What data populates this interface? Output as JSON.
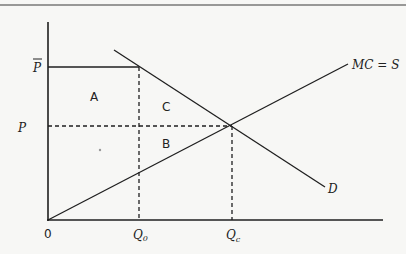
{
  "diagram": {
    "type": "supply-demand welfare diagram",
    "axes": {
      "origin_label": "0",
      "x_ticks": [
        {
          "label": "Q",
          "subscript": "0",
          "x": 139
        },
        {
          "label": "Q",
          "subscript": "c",
          "x": 232
        }
      ],
      "y_ticks": [
        {
          "label": "P",
          "overline": true,
          "name": "P-bar",
          "y": 67
        },
        {
          "label": "P",
          "overline": false,
          "name": "P",
          "y": 126
        }
      ]
    },
    "curves": {
      "demand": {
        "label": "D",
        "from": [
          114,
          50
        ],
        "to": [
          325,
          187
        ]
      },
      "supply": {
        "label": "MC = S",
        "from": [
          48,
          220
        ],
        "to": [
          348,
          64
        ]
      }
    },
    "regions": [
      {
        "label": "A",
        "x": 94,
        "y": 96
      },
      {
        "label": "C",
        "x": 166,
        "y": 106
      },
      {
        "label": "B",
        "x": 166,
        "y": 143
      }
    ],
    "colors": {
      "ink": "#1f1f1f",
      "background": "#f7f7f5"
    }
  }
}
